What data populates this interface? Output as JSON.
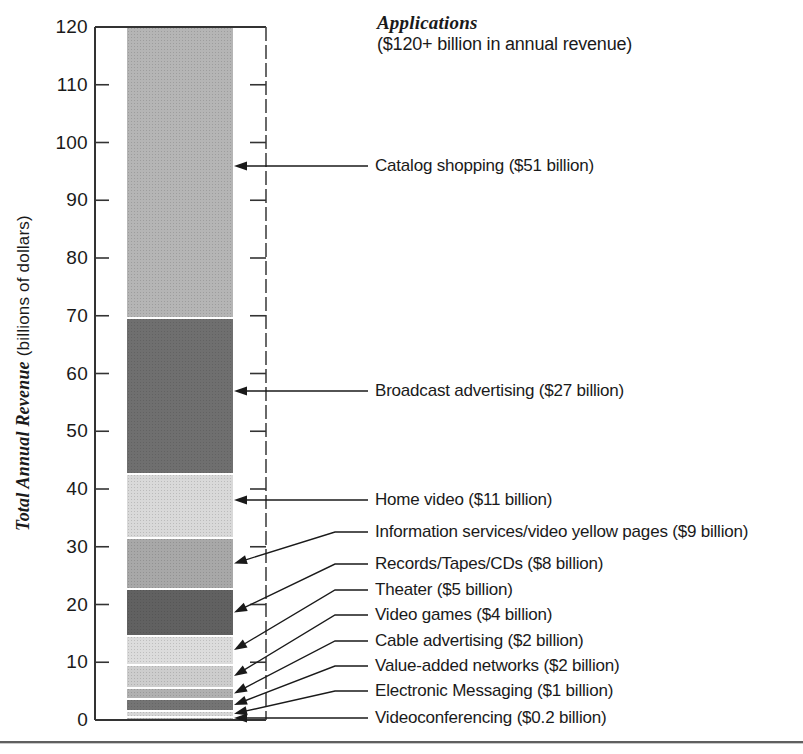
{
  "figure": {
    "title": "Applications",
    "subtitle": "($120+ billion in annual revenue)",
    "y_axis_title_em": "Total Annual Revenue",
    "y_axis_title_rest": " (billions of dollars)"
  },
  "chart_data": {
    "type": "bar",
    "stacked": true,
    "title": "Applications ($120+ billion in annual revenue)",
    "ylabel": "Total Annual Revenue (billions of dollars)",
    "ylim": [
      0,
      120
    ],
    "yticks": [
      0,
      10,
      20,
      30,
      40,
      50,
      60,
      70,
      80,
      90,
      100,
      110,
      120
    ],
    "grid": false,
    "legend": "right-side leader-line annotations",
    "total": "120+",
    "segments_bottom_up": [
      {
        "name": "Videoconferencing",
        "value": 0.2,
        "label": "Videoconferencing ($0.2 billion)",
        "color": "#b3b3b3",
        "label_y": 718
      },
      {
        "name": "Electronic Messaging",
        "value": 1,
        "label": "Electronic Messaging ($1 billion)",
        "color": "#d7d7d7",
        "label_y": 691
      },
      {
        "name": "Value-added networks",
        "value": 2,
        "label": "Value-added networks ($2 billion)",
        "color": "#747474",
        "label_y": 666
      },
      {
        "name": "Cable advertising",
        "value": 2,
        "label": "Cable advertising ($2 billion)",
        "color": "#b0b0b0",
        "label_y": 641
      },
      {
        "name": "Video games",
        "value": 4,
        "label": "Video games ($4 billion)",
        "color": "#cdcdcd",
        "label_y": 615
      },
      {
        "name": "Theater",
        "value": 5,
        "label": "Theater ($5 billion)",
        "color": "#dcdcdc",
        "label_y": 590
      },
      {
        "name": "Records/Tapes/CDs",
        "value": 8,
        "label": "Records/Tapes/CDs ($8 billion)",
        "color": "#616161",
        "label_y": 564
      },
      {
        "name": "Information services/video yellow pages",
        "value": 9,
        "label": "Information services/video yellow pages ($9 billion)",
        "color": "#a8a8a8",
        "label_y": 532
      },
      {
        "name": "Home video",
        "value": 11,
        "label": "Home video ($11 billion)",
        "color": "#d9d9d9",
        "label_y": 500
      },
      {
        "name": "Broadcast advertising",
        "value": 27,
        "label": "Broadcast advertising ($27 billion)",
        "color": "#6f6f6f",
        "label_y": 391
      },
      {
        "name": "Catalog shopping",
        "value": 51,
        "label": "Catalog shopping ($51 billion)",
        "color": "#b5b5b5",
        "label_y": 166
      }
    ]
  }
}
